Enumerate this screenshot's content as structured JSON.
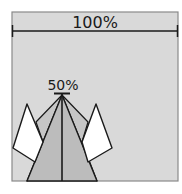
{
  "diagram": {
    "width_label": "100%",
    "height_label": "50%",
    "colors": {
      "background": "#d9d9d9",
      "border": "#8a8a8a",
      "triangle": "#bcbcbc",
      "fan": "#c8c8c8",
      "kite": "#ffffff",
      "line": "#1a1a1a"
    }
  }
}
